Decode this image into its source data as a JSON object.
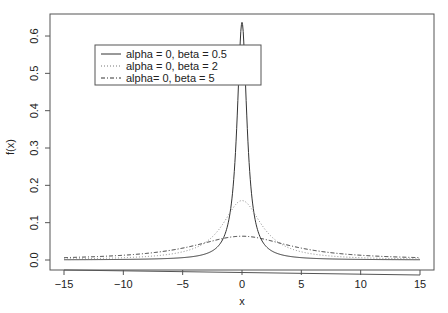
{
  "chart_data": {
    "type": "line",
    "title": "",
    "xlabel": "x",
    "ylabel": "f(x)",
    "xlim": [
      -15,
      15
    ],
    "ylim": [
      0,
      0.65
    ],
    "xticks": [
      -15,
      -10,
      -5,
      0,
      5,
      10,
      15
    ],
    "xtick_labels": [
      "−15",
      "−10",
      "−5",
      "0",
      "5",
      "10",
      "15"
    ],
    "yticks": [
      0.0,
      0.1,
      0.2,
      0.3,
      0.4,
      0.5,
      0.6
    ],
    "ytick_labels": [
      "0.0",
      "0.1",
      "0.2",
      "0.3",
      "0.4",
      "0.5",
      "0.6"
    ],
    "grid": false,
    "legend_position": "upper-left",
    "series": [
      {
        "name": "alpha = 0, beta = 0.5",
        "style": "solid",
        "alpha": 0,
        "beta": 0.5,
        "peak": 0.637
      },
      {
        "name": "alpha = 0, beta = 2",
        "style": "dotted",
        "alpha": 0,
        "beta": 2,
        "peak": 0.159
      },
      {
        "name": "alpha= 0, beta = 5",
        "style": "dashdot",
        "alpha": 0,
        "beta": 5,
        "peak": 0.064
      }
    ],
    "x": [
      -15,
      -10,
      -5,
      -2,
      -1,
      -0.5,
      0,
      0.5,
      1,
      2,
      5,
      10,
      15
    ],
    "values_by_series": [
      [
        0.0007,
        0.0016,
        0.0063,
        0.0374,
        0.1273,
        0.3183,
        0.6366,
        0.3183,
        0.1273,
        0.0374,
        0.0063,
        0.0016,
        0.0007
      ],
      [
        0.0028,
        0.0061,
        0.022,
        0.0796,
        0.1273,
        0.1498,
        0.1592,
        0.1498,
        0.1273,
        0.0796,
        0.022,
        0.0061,
        0.0028
      ],
      [
        0.0064,
        0.0127,
        0.0318,
        0.0549,
        0.0612,
        0.063,
        0.0637,
        0.063,
        0.0612,
        0.0549,
        0.0318,
        0.0127,
        0.0064
      ]
    ]
  }
}
